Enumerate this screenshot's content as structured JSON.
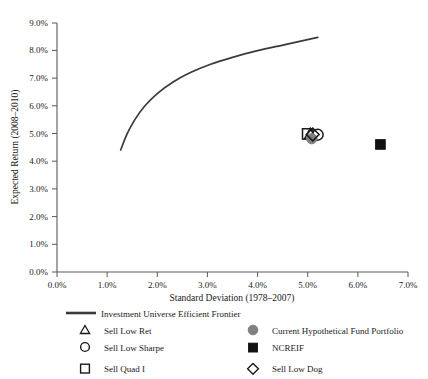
{
  "chart_data": {
    "type": "scatter",
    "title": "",
    "xlabel": "Standard Deviation (1978–2007)",
    "ylabel": "Expected Return (2008–2010)",
    "xlim": [
      0.0,
      7.0
    ],
    "ylim": [
      0.0,
      9.0
    ],
    "grid": false,
    "legend_position": "bottom",
    "x_ticks": [
      "0.0%",
      "1.0%",
      "2.0%",
      "3.0%",
      "4.0%",
      "5.0%",
      "6.0%",
      "7.0%"
    ],
    "x_tick_values": [
      0.0,
      1.0,
      2.0,
      3.0,
      4.0,
      5.0,
      6.0,
      7.0
    ],
    "y_ticks": [
      "0.0%",
      "1.0%",
      "2.0%",
      "3.0%",
      "4.0%",
      "5.0%",
      "6.0%",
      "7.0%",
      "8.0%",
      "9.0%"
    ],
    "y_tick_values": [
      0.0,
      1.0,
      2.0,
      3.0,
      4.0,
      5.0,
      6.0,
      7.0,
      8.0,
      9.0
    ],
    "series": [
      {
        "name": "Investment Universe Efficient Frontier",
        "type": "line",
        "marker": "line",
        "color": "#3a3a3a",
        "points": [
          {
            "x": 1.27,
            "y": 4.41
          },
          {
            "x": 1.4,
            "y": 5.0
          },
          {
            "x": 1.55,
            "y": 5.5
          },
          {
            "x": 1.75,
            "y": 6.0
          },
          {
            "x": 2.0,
            "y": 6.45
          },
          {
            "x": 2.3,
            "y": 6.85
          },
          {
            "x": 2.65,
            "y": 7.2
          },
          {
            "x": 3.05,
            "y": 7.5
          },
          {
            "x": 3.5,
            "y": 7.76
          },
          {
            "x": 4.0,
            "y": 8.0
          },
          {
            "x": 4.55,
            "y": 8.22
          },
          {
            "x": 5.2,
            "y": 8.48
          }
        ]
      },
      {
        "name": "Sell Low Ret",
        "type": "point",
        "marker": "triangle-open",
        "color": "#1a1a1a",
        "points": [
          {
            "x": 5.05,
            "y": 4.98
          }
        ]
      },
      {
        "name": "Sell Low Sharpe",
        "type": "point",
        "marker": "circle-open",
        "color": "#1a1a1a",
        "points": [
          {
            "x": 5.2,
            "y": 4.96
          }
        ]
      },
      {
        "name": "Sell Quad I",
        "type": "point",
        "marker": "square-open",
        "color": "#1a1a1a",
        "points": [
          {
            "x": 5.0,
            "y": 4.99
          }
        ]
      },
      {
        "name": "Current Hypothetical Fund Portfolio",
        "type": "point",
        "marker": "circle-filled",
        "color": "#808080",
        "points": [
          {
            "x": 5.08,
            "y": 4.82
          }
        ]
      },
      {
        "name": "NCREIF",
        "type": "point",
        "marker": "square-filled",
        "color": "#111111",
        "points": [
          {
            "x": 6.45,
            "y": 4.61
          }
        ]
      },
      {
        "name": "Sell Low Dog",
        "type": "point",
        "marker": "diamond-open",
        "color": "#1a1a1a",
        "points": [
          {
            "x": 5.1,
            "y": 4.97
          }
        ]
      }
    ]
  },
  "axes": {
    "x_title": "Standard Deviation (1978–2007)",
    "y_title": "Expected Return (2008–2010)",
    "x_tick_labels": [
      "0.0%",
      "1.0%",
      "2.0%",
      "3.0%",
      "4.0%",
      "5.0%",
      "6.0%",
      "7.0%"
    ],
    "y_tick_labels": [
      "0.0%",
      "1.0%",
      "2.0%",
      "3.0%",
      "4.0%",
      "5.0%",
      "6.0%",
      "7.0%",
      "8.0%",
      "9.0%"
    ],
    "axis_color": "#595959"
  },
  "legend": {
    "frontier": {
      "label": "Investment Universe Efficient Frontier",
      "marker": "line-segment",
      "color": "#3a3a3a"
    },
    "left_column": [
      {
        "label": "Sell Low Ret",
        "marker": "triangle-open",
        "color": "#1a1a1a"
      },
      {
        "label": "Sell Low Sharpe",
        "marker": "circle-open",
        "color": "#1a1a1a"
      },
      {
        "label": "Sell Quad I",
        "marker": "square-open",
        "color": "#1a1a1a"
      }
    ],
    "right_column": [
      {
        "label": "Current Hypothetical Fund Portfolio",
        "marker": "circle-filled",
        "color": "#808080"
      },
      {
        "label": "NCREIF",
        "marker": "square-filled",
        "color": "#111111"
      },
      {
        "label": "Sell Low Dog",
        "marker": "diamond-open",
        "color": "#1a1a1a"
      }
    ]
  }
}
